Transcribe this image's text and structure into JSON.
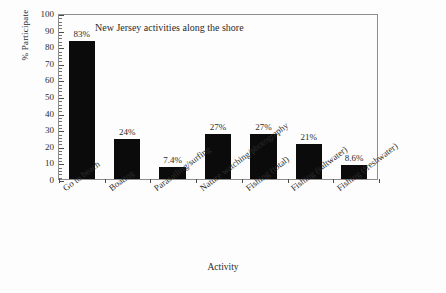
{
  "chart_data": {
    "type": "bar",
    "title": "New Jersey activities along the shore",
    "xlabel": "Activity",
    "ylabel": "% Participate",
    "ylim": [
      0,
      100
    ],
    "ytick_step": 10,
    "yticks": [
      100,
      90,
      80,
      70,
      60,
      50,
      40,
      30,
      20,
      10,
      0
    ],
    "grid": false,
    "legend": false,
    "bar_color": "#0b0b0b",
    "categories": [
      "Go to beach",
      "Boating",
      "Parasailing/surfing",
      "Nature watching/photography",
      "Fishing (total)",
      "Fishing (saltwater)",
      "Fishing (freshwater)"
    ],
    "values": [
      83,
      24,
      7.4,
      27,
      27,
      21,
      8.6
    ],
    "data_labels": [
      "83%",
      "24%",
      "7.4%",
      "27%",
      "27%",
      "21%",
      "8.6%"
    ]
  }
}
